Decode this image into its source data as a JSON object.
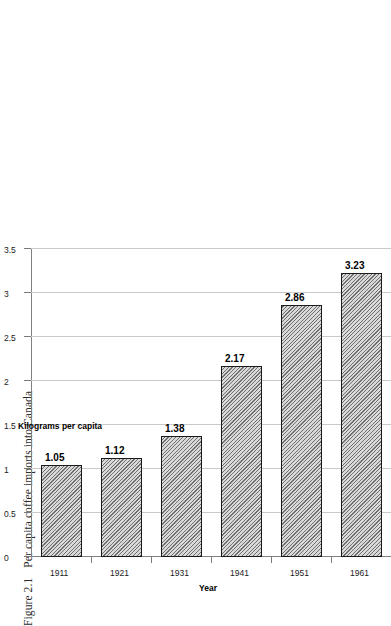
{
  "figure": {
    "number": "Figure 2.1",
    "caption": "Per capita coffee imports into Canada"
  },
  "chart_data": {
    "type": "bar",
    "orientation": "horizontal-rotated",
    "title": "",
    "xlabel": "Year",
    "ylabel": "Kilograms per capita",
    "categories": [
      "1911",
      "1921",
      "1931",
      "1941",
      "1951",
      "1961"
    ],
    "values": [
      1.05,
      1.12,
      1.38,
      2.17,
      2.86,
      3.23
    ],
    "data_labels": [
      "1.05",
      "1.12",
      "1.38",
      "2.17",
      "2.86",
      "3.23"
    ],
    "value_axis_ticks": [
      "0",
      "0.5",
      "1",
      "1.5",
      "2",
      "2.5",
      "3",
      "3.5"
    ],
    "value_axis_tick_values": [
      0,
      0.5,
      1,
      1.5,
      2,
      2.5,
      3,
      3.5
    ],
    "ylim": [
      0,
      3.5
    ],
    "grid": true,
    "legend": false,
    "series_name": "Kilograms per capita",
    "bar_fill": "#d9d9d9",
    "bar_hatch": "diagonal-45",
    "bar_border": "#1a1a1a",
    "gridline_color": "#c9c9c9",
    "axis_color": "#808080"
  }
}
